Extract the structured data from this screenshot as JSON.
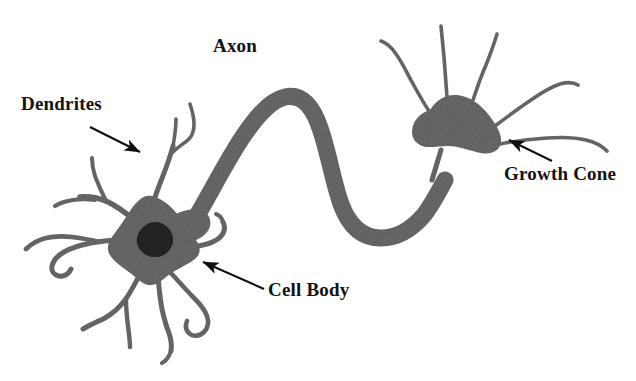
{
  "figure": {
    "background_color": "#ffffff",
    "ink_color": "#6b6b6b",
    "nucleus_color": "#262626",
    "label_color": "#131313",
    "arrow_color": "#101010"
  },
  "labels": [
    {
      "id": "axon",
      "text": "Axon",
      "x": 213,
      "y": 36,
      "font_size": 19,
      "points_to": "axon-shaft",
      "has_arrow": false
    },
    {
      "id": "dendrites",
      "text": "Dendrites",
      "x": 21,
      "y": 94,
      "font_size": 19,
      "points_to": "dendrite-branch",
      "has_arrow": true
    },
    {
      "id": "growth_cone",
      "text": "Growth Cone",
      "x": 504,
      "y": 164,
      "font_size": 19,
      "points_to": "growth-cone-body",
      "has_arrow": true
    },
    {
      "id": "cell_body",
      "text": "Cell Body",
      "x": 268,
      "y": 280,
      "font_size": 19,
      "points_to": "soma",
      "has_arrow": true
    }
  ],
  "arrows": [
    {
      "id": "arrow-dendrites",
      "from_x": 90,
      "from_y": 127,
      "to_x": 141,
      "to_y": 153
    },
    {
      "id": "arrow-cell-body",
      "from_x": 264,
      "from_y": 289,
      "to_x": 201,
      "to_y": 261
    },
    {
      "id": "arrow-growth-cone",
      "from_x": 552,
      "from_y": 161,
      "to_x": 507,
      "to_y": 139
    }
  ],
  "structures": [
    {
      "id": "soma",
      "name": "Cell body (soma)",
      "center_x": 152,
      "center_y": 243
    },
    {
      "id": "nucleus",
      "name": "Nucleus",
      "center_x": 155,
      "center_y": 240
    },
    {
      "id": "axon-shaft",
      "name": "Axon",
      "center_x": 320,
      "center_y": 150
    },
    {
      "id": "growth-cone-body",
      "name": "Growth cone",
      "center_x": 452,
      "center_y": 117
    },
    {
      "id": "dendrite-branch",
      "name": "Dendrites",
      "center_x": 120,
      "center_y": 200
    }
  ]
}
